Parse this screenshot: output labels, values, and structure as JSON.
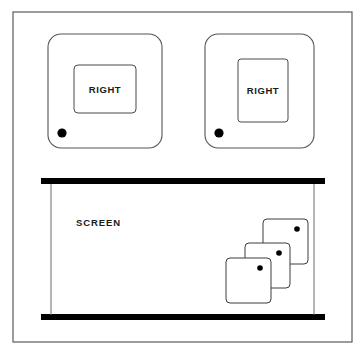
{
  "diagram": {
    "background_color": "#ffffff",
    "line_color": "#4a4a4a",
    "bar_color": "#000000",
    "dot_color": "#000000",
    "frame": {
      "x": 13,
      "y": 12,
      "width": 339,
      "height": 330
    },
    "panels": [
      {
        "id": "left-panel",
        "label": "RIGHT",
        "x": 48,
        "y": 34,
        "width": 114,
        "height": 114,
        "radius": 13,
        "inner": {
          "x": 74,
          "y": 65,
          "width": 62,
          "height": 48,
          "radius": 4
        },
        "dot": {
          "cx": 62,
          "cy": 133,
          "r": 4.6
        }
      },
      {
        "id": "right-panel",
        "label": "RIGHT",
        "x": 205,
        "y": 34,
        "width": 109,
        "height": 114,
        "radius": 13,
        "inner": {
          "x": 238,
          "y": 59,
          "width": 50,
          "height": 63,
          "radius": 3
        },
        "dot": {
          "cx": 219,
          "cy": 133,
          "r": 4.6
        }
      }
    ],
    "screen": {
      "label": "SCREEN",
      "label_x": 76,
      "label_y": 226,
      "top_bar": {
        "x": 41,
        "y": 178,
        "width": 284,
        "height": 6
      },
      "bottom_bar": {
        "x": 41,
        "y": 314,
        "width": 284,
        "height": 6
      },
      "left_rail": {
        "x": 51,
        "y1": 184,
        "y2": 315
      },
      "right_rail": {
        "x": 314,
        "y1": 184,
        "y2": 315
      }
    },
    "cards": [
      {
        "id": "card-back",
        "x": 263,
        "y": 219,
        "width": 45,
        "height": 45,
        "radius": 4,
        "dot": {
          "cx": 297,
          "cy": 229,
          "r": 2.8
        }
      },
      {
        "id": "card-mid",
        "x": 245,
        "y": 243,
        "width": 45,
        "height": 45,
        "radius": 4,
        "dot": {
          "cx": 279,
          "cy": 253,
          "r": 2.8
        }
      },
      {
        "id": "card-front",
        "x": 226,
        "y": 258,
        "width": 45,
        "height": 45,
        "radius": 4,
        "dot": {
          "cx": 260,
          "cy": 268,
          "r": 2.8
        }
      }
    ]
  }
}
